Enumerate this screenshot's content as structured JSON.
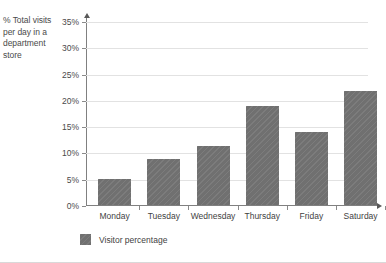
{
  "chart_data": {
    "type": "bar",
    "title": "",
    "subtitle": "",
    "xlabel": "",
    "ylabel": "% Total visits per day in a department store",
    "categories": [
      "Monday",
      "Tuesday",
      "Wednesday",
      "Thursday",
      "Friday",
      "Saturday"
    ],
    "series": [
      {
        "name": "Visitor percentage",
        "values": [
          5.0,
          8.7,
          11.3,
          18.8,
          13.9,
          21.7
        ],
        "color": "#707070"
      }
    ],
    "ylim": [
      0,
      35
    ],
    "ytick_values": [
      0,
      5,
      10,
      15,
      20,
      25,
      30,
      35
    ],
    "ytick_labels": [
      "0%",
      "5%",
      "10%",
      "15%",
      "20%",
      "25%",
      "30%",
      "35%"
    ],
    "grid": true,
    "grid_axis": "y",
    "legend": [
      "Visitor percentage"
    ],
    "legend_position": "bottom-left",
    "annotations": []
  },
  "axis_title": {
    "line1": "% Total visits",
    "line2": "per day in a",
    "line3": "department",
    "line4": "store"
  },
  "legend": {
    "entry_label": "Visitor percentage"
  },
  "colors": {
    "bar_fill": "#707070",
    "gridline": "#e2e2e2",
    "axis": "#808080",
    "text": "#3f3f3f",
    "background": "#ffffff"
  }
}
